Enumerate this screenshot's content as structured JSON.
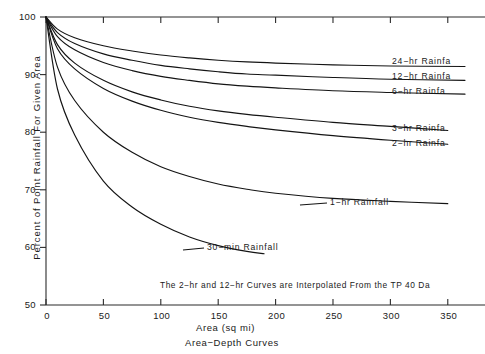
{
  "chart_data": {
    "type": "line",
    "title": "",
    "subtitle": "Area−Depth Curves",
    "xlabel": "Area (sq mi)",
    "ylabel": "Percent of Point Rainfall For Given Area",
    "xlim": [
      0,
      365
    ],
    "ylim": [
      50,
      100
    ],
    "xticks": [
      0,
      50,
      100,
      150,
      200,
      250,
      300,
      350
    ],
    "yticks": [
      50,
      60,
      70,
      80,
      90,
      100
    ],
    "xtick_labels": [
      "0",
      "50",
      "100",
      "150",
      "200",
      "250",
      "300",
      "350"
    ],
    "ytick_labels": [
      "50",
      "60",
      "70",
      "80",
      "90",
      "100"
    ],
    "grid": false,
    "legend_position": "inline-right-labels",
    "annotation": "The 2−hr and 12−hr Curves are Interpolated From the TP 40 Da",
    "series": [
      {
        "name": "24−hr Rainfa",
        "label_y": 91.5,
        "x": [
          0,
          10,
          25,
          50,
          75,
          100,
          125,
          150,
          175,
          200,
          250,
          300,
          365
        ],
        "values": [
          100,
          97.9,
          96.4,
          95.0,
          94.1,
          93.4,
          92.9,
          92.5,
          92.2,
          92.0,
          91.7,
          91.5,
          91.4
        ]
      },
      {
        "name": "12−hr Rainfa",
        "label_y": 89.0,
        "x": [
          0,
          10,
          25,
          50,
          75,
          100,
          125,
          150,
          175,
          200,
          250,
          300,
          365
        ],
        "values": [
          100,
          97.3,
          95.4,
          93.6,
          92.5,
          91.6,
          91.0,
          90.5,
          90.1,
          89.9,
          89.5,
          89.2,
          89.0
        ]
      },
      {
        "name": "6−hr Rainfa",
        "label_y": 86.5,
        "x": [
          0,
          10,
          25,
          50,
          75,
          100,
          125,
          150,
          175,
          200,
          250,
          300,
          365
        ],
        "values": [
          100,
          96.6,
          94.3,
          92.1,
          90.7,
          89.7,
          89.0,
          88.4,
          88.0,
          87.7,
          87.2,
          86.9,
          86.6
        ]
      },
      {
        "name": "3−hr Rainfa",
        "label_y": 80.0,
        "x": [
          0,
          10,
          25,
          50,
          75,
          100,
          125,
          150,
          175,
          200,
          250,
          300,
          350
        ],
        "values": [
          100,
          95.2,
          92.0,
          89.0,
          87.0,
          85.6,
          84.5,
          83.7,
          83.1,
          82.6,
          81.7,
          81.0,
          80.3
        ]
      },
      {
        "name": "2−hr Rainfa",
        "label_y": 77.5,
        "x": [
          0,
          10,
          25,
          50,
          75,
          100,
          125,
          150,
          175,
          200,
          250,
          300,
          350
        ],
        "values": [
          100,
          94.5,
          91.0,
          87.6,
          85.4,
          83.8,
          82.6,
          81.7,
          81.0,
          80.4,
          79.4,
          78.6,
          77.9
        ]
      },
      {
        "name": "1−hr Rainfall",
        "label_y": 67.8,
        "x": [
          0,
          10,
          25,
          50,
          75,
          100,
          125,
          150,
          175,
          200,
          250,
          300,
          350
        ],
        "values": [
          100,
          91.3,
          85.5,
          80.0,
          76.5,
          74.0,
          72.3,
          71.0,
          70.1,
          69.4,
          68.5,
          68.0,
          67.6
        ]
      },
      {
        "name": "30−min Rainfall",
        "label_y": 58.8,
        "x": [
          0,
          10,
          25,
          50,
          75,
          100,
          125,
          150,
          175,
          190
        ],
        "values": [
          100,
          87.5,
          79.5,
          71.5,
          67.0,
          64.0,
          61.8,
          60.3,
          59.3,
          58.9
        ]
      }
    ]
  },
  "labels": {
    "curve_labels": [
      "24−hr Rainfa",
      "12−hr Rainfa",
      "6−hr Rainfa",
      "3−hr Rainfa",
      "2−hr Rainfa",
      "1−hr Rainfall",
      "30−min Rainfall"
    ]
  }
}
